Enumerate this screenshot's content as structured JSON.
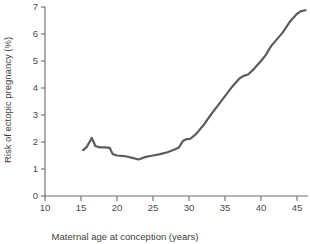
{
  "chart_data": {
    "type": "line",
    "title": "",
    "xlabel": "Maternal age at conception (years)",
    "ylabel": "Risk of ectopic pregnancy (%)",
    "xlim": [
      10,
      46.5
    ],
    "ylim": [
      0,
      7
    ],
    "grid": false,
    "legend": "none",
    "line_color": "#5c5c5c",
    "axis_color": "#6b6b6b",
    "xticks": [
      10,
      15,
      20,
      25,
      30,
      35,
      40,
      45
    ],
    "xtick_labels": [
      "10",
      "15",
      "20",
      "25",
      "30",
      "35",
      "40",
      "45"
    ],
    "yticks": [
      0,
      1,
      2,
      3,
      4,
      5,
      6,
      7
    ],
    "ytick_labels": [
      "0",
      "1",
      "2",
      "3",
      "4",
      "5",
      "6",
      "7"
    ],
    "series": [
      {
        "name": "Risk of ectopic pregnancy",
        "x": [
          15.3,
          15.8,
          16.5,
          17.0,
          17.6,
          18.3,
          19.0,
          19.4,
          20.0,
          21.0,
          22.0,
          23.0,
          24.0,
          25.0,
          26.0,
          27.0,
          28.0,
          28.6,
          29.2,
          29.6,
          30.2,
          31.0,
          32.0,
          33.0,
          34.0,
          35.0,
          36.0,
          37.0,
          37.6,
          38.2,
          39.0,
          40.0,
          40.6,
          41.4,
          42.2,
          43.0,
          44.0,
          45.0,
          45.6,
          46.2
        ],
        "y": [
          1.7,
          1.82,
          2.15,
          1.85,
          1.8,
          1.8,
          1.78,
          1.55,
          1.5,
          1.48,
          1.42,
          1.35,
          1.45,
          1.5,
          1.55,
          1.62,
          1.72,
          1.8,
          2.05,
          2.1,
          2.12,
          2.3,
          2.62,
          3.0,
          3.35,
          3.7,
          4.05,
          4.35,
          4.45,
          4.5,
          4.7,
          5.0,
          5.2,
          5.55,
          5.8,
          6.05,
          6.45,
          6.75,
          6.85,
          6.88
        ]
      }
    ]
  },
  "axes": {
    "x_title": "Maternal age at conception (years)",
    "y_title": "Risk of ectopic pregnancy (%)"
  }
}
